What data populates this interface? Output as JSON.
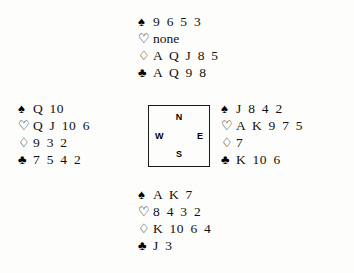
{
  "diagram": {
    "type": "bridge-deal",
    "suit_symbols": {
      "spade": "♠",
      "heart": "♡",
      "diamond": "♢",
      "club": "♣"
    },
    "compass": {
      "north": "N",
      "west": "W",
      "east": "E",
      "south": "S"
    },
    "hands": {
      "north": {
        "label": "North",
        "spades": "9 6 5 3",
        "hearts": "none",
        "diamonds": "A Q J 8 5",
        "clubs": "A Q 9 8"
      },
      "west": {
        "label": "West",
        "spades": "Q 10",
        "hearts": "Q J 10 6",
        "diamonds": "9 3 2",
        "clubs": "7 5 4 2"
      },
      "east": {
        "label": "East",
        "spades": "J 8 4 2",
        "hearts": "A K 9 7 5",
        "diamonds": "7",
        "clubs": "K 10 6"
      },
      "south": {
        "label": "South",
        "spades": "A K 7",
        "hearts": "8 4 3 2",
        "diamonds": "K 10 6 4",
        "clubs": "J 3"
      }
    }
  }
}
